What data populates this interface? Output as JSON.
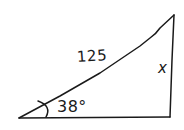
{
  "diagram": {
    "type": "right-triangle",
    "style": "hand-drawn",
    "stroke_color": "#1a1a1a",
    "background_color": "#ffffff",
    "labels": {
      "hypotenuse": "125",
      "opposite_side": "x",
      "angle": "38°"
    },
    "vertices": {
      "bottom_left": [
        19,
        118
      ],
      "bottom_right_right_angle": [
        170,
        117
      ],
      "top": [
        174,
        15
      ]
    }
  }
}
